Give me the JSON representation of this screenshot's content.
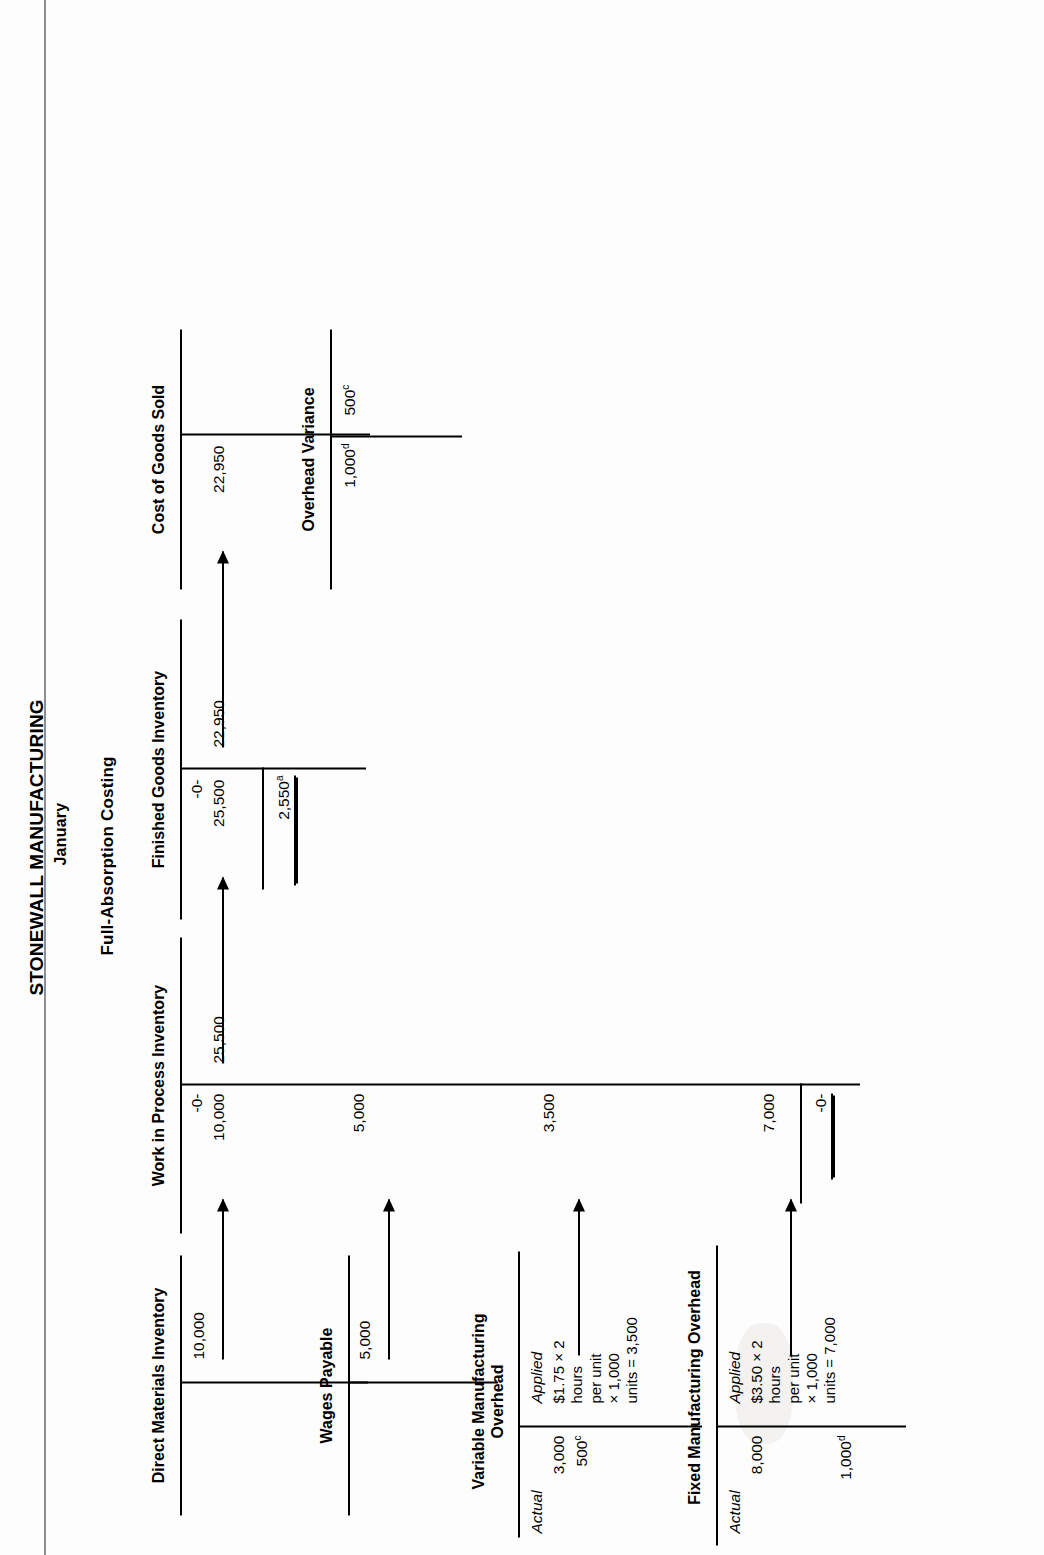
{
  "document": {
    "company": "STONEWALL MANUFACTURING",
    "period": "January",
    "method": "Full-Absorption Costing",
    "page_edge_color": "#8e8e8e"
  },
  "accounts": {
    "direct_materials": {
      "title": "Direct Materials Inventory",
      "credit_entry": "10,000"
    },
    "work_in_process": {
      "title": "Work in Process Inventory",
      "beginning_balance": "-0-",
      "debit_materials": "10,000",
      "debit_labor": "5,000",
      "debit_variable_oh": "3,500",
      "debit_fixed_oh": "7,000",
      "credit_transfer": "25,500",
      "ending_balance": "-0-"
    },
    "finished_goods": {
      "title": "Finished Goods Inventory",
      "beginning_balance": "-0-",
      "debit_transfer": "25,500",
      "credit_cogs": "22,950",
      "ending_balance": "2,550",
      "ending_balance_note": "a"
    },
    "cost_of_goods_sold": {
      "title": "Cost of Goods Sold",
      "debit_entry": "22,950"
    },
    "wages_payable": {
      "title": "Wages Payable",
      "credit_entry": "5,000"
    },
    "variable_moh": {
      "title": "Variable Manufacturing\nOverhead",
      "actual_label": "Actual",
      "actual_amount": "3,000",
      "actual_variance": "500",
      "actual_variance_note": "c",
      "applied_label": "Applied",
      "applied_detail": "$1.75 × 2\nhours\nper unit\n× 1,000\nunits = 3,500",
      "applied_amount": "3,500"
    },
    "fixed_moh": {
      "title": "Fixed Manufacturing Overhead",
      "actual_label": "Actual",
      "actual_amount": "8,000",
      "applied_label": "Applied",
      "applied_detail": "$3.50 × 2\nhours\nper unit\n× 1,000\nunits = 7,000",
      "applied_amount": "7,000",
      "variance_amount": "1,000",
      "variance_note": "d",
      "ending_balance": "-0-"
    },
    "overhead_variance": {
      "title": "Overhead Variance",
      "debit_entry": "1,000",
      "debit_note": "d",
      "credit_entry": "500",
      "credit_note": "c"
    }
  },
  "flows": {
    "materials_to_wip": "10,000",
    "wages_to_wip": "5,000",
    "vmoh_to_wip": "3,500",
    "fmoh_to_wip": "7,000",
    "wip_to_fg": "25,500",
    "fg_to_cogs": "22,950"
  }
}
